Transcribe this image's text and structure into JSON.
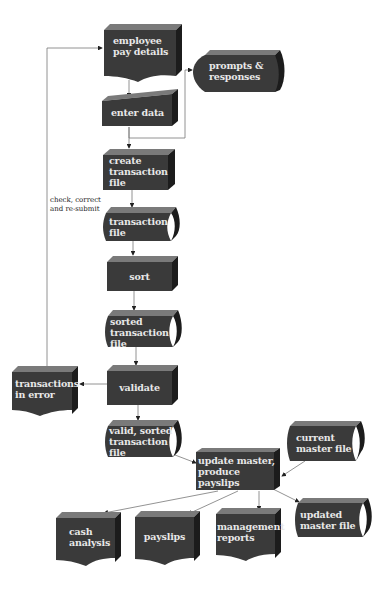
{
  "diagram": {
    "type": "system flowchart",
    "colors": {
      "box_front": "#3a3a3a",
      "box_top": "#7a7a7a",
      "box_side": "#1c1c1c",
      "text": "#e8e8e8",
      "line": "#666666"
    },
    "nodes": {
      "employee_pay_details": {
        "label_1": "employee",
        "label_2": "pay details",
        "shape": "document"
      },
      "prompts_responses": {
        "label_1": "prompts &",
        "label_2": "responses",
        "shape": "display"
      },
      "enter_data": {
        "label_1": "enter data",
        "shape": "manual-input"
      },
      "create_transaction_file": {
        "label_1": "create",
        "label_2": "transaction",
        "label_3": "file",
        "shape": "process"
      },
      "transaction_file": {
        "label_1": "transaction",
        "label_2": "file",
        "shape": "stored-data"
      },
      "sort": {
        "label_1": "sort",
        "shape": "process"
      },
      "sorted_transaction_file": {
        "label_1": "sorted",
        "label_2": "transaction",
        "label_3": "file",
        "shape": "stored-data"
      },
      "validate": {
        "label_1": "validate",
        "shape": "process"
      },
      "transactions_in_error": {
        "label_1": "transactions",
        "label_2": "in error",
        "shape": "document"
      },
      "valid_sorted_transaction_file": {
        "label_1": "valid, sorted",
        "label_2": "transaction",
        "label_3": "file",
        "shape": "stored-data"
      },
      "update_master": {
        "label_1": "update master,",
        "label_2": "produce",
        "label_3": "payslips",
        "shape": "process"
      },
      "current_master_file": {
        "label_1": "current",
        "label_2": "master file",
        "shape": "stored-data"
      },
      "cash_analysis": {
        "label_1": "cash",
        "label_2": "analysis",
        "shape": "document"
      },
      "payslips": {
        "label_1": "payslips",
        "shape": "document"
      },
      "management_reports": {
        "label_1": "management",
        "label_2": "reports",
        "shape": "document"
      },
      "updated_master_file": {
        "label_1": "updated",
        "label_2": "master file",
        "shape": "stored-data"
      }
    },
    "annotations": {
      "feedback_loop": {
        "line_1": "check, correct",
        "line_2": "and re-submit"
      }
    },
    "edges": [
      [
        "employee_pay_details",
        "enter_data"
      ],
      [
        "enter_data",
        "prompts_responses"
      ],
      [
        "enter_data",
        "create_transaction_file"
      ],
      [
        "create_transaction_file",
        "transaction_file"
      ],
      [
        "transaction_file",
        "sort"
      ],
      [
        "sort",
        "sorted_transaction_file"
      ],
      [
        "sorted_transaction_file",
        "validate"
      ],
      [
        "validate",
        "transactions_in_error"
      ],
      [
        "transactions_in_error",
        "employee_pay_details"
      ],
      [
        "validate",
        "valid_sorted_transaction_file"
      ],
      [
        "valid_sorted_transaction_file",
        "update_master"
      ],
      [
        "current_master_file",
        "update_master"
      ],
      [
        "update_master",
        "cash_analysis"
      ],
      [
        "update_master",
        "payslips"
      ],
      [
        "update_master",
        "management_reports"
      ],
      [
        "update_master",
        "updated_master_file"
      ]
    ]
  }
}
